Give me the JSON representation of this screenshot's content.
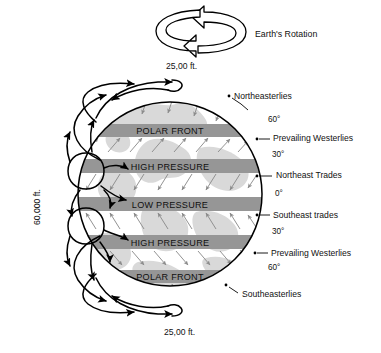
{
  "diagram": {
    "globe": {
      "center_x": 170,
      "center_y": 194,
      "radius": 92,
      "ocean_color": "#ffffff",
      "land_color": "#d9d9d9",
      "band_color": "#969696",
      "outline_color": "#000000",
      "wind_arrow_color": "#8c8c8c"
    },
    "bands": [
      {
        "label": "POLAR FRONT",
        "y": 124,
        "height": 13
      },
      {
        "label": "HIGH PRESSURE",
        "y": 159,
        "height": 14
      },
      {
        "label": "LOW PRESSURE",
        "y": 197,
        "height": 14
      },
      {
        "label": "HIGH PRESSURE",
        "y": 235,
        "height": 14
      },
      {
        "label": "POLAR FRONT",
        "y": 270,
        "height": 13
      }
    ],
    "latitude_marks": [
      {
        "label": "60°",
        "x": 268,
        "y": 120
      },
      {
        "label": "30°",
        "x": 272,
        "y": 155
      },
      {
        "label": "0°",
        "x": 275,
        "y": 194
      },
      {
        "label": "30°",
        "x": 272,
        "y": 232
      },
      {
        "label": "60°",
        "x": 268,
        "y": 268
      }
    ],
    "wind_labels": [
      {
        "label": "Northeasterlies",
        "x": 234,
        "y": 96,
        "anchor": "start"
      },
      {
        "label": "Prevailing Westerlies",
        "x": 276,
        "y": 138,
        "anchor": "start"
      },
      {
        "label": "Northeast Trades",
        "x": 280,
        "y": 175,
        "anchor": "start"
      },
      {
        "label": "Southeast trades",
        "x": 276,
        "y": 215,
        "anchor": "start"
      },
      {
        "label": "Prevailing Westerlies",
        "x": 274,
        "y": 253,
        "anchor": "start"
      },
      {
        "label": "Southeasterlies",
        "x": 243,
        "y": 294,
        "anchor": "start"
      }
    ],
    "altitude_labels": {
      "top": "25,00 ft.",
      "bottom": "25,00 ft.",
      "side": "60,000 ft."
    },
    "rotation_label": "Earth's Rotation",
    "rotation_arrow": {
      "name": "earths-rotation-arrow",
      "fill": "#ffffff",
      "stroke": "#000000"
    },
    "cells": {
      "name": "atmospheric-circulation-cells",
      "stroke": "#000000",
      "count": 2
    }
  }
}
